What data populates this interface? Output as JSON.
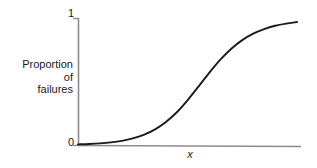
{
  "figure": {
    "background_color": "#ffffff",
    "axis_color": "#8c8c8c",
    "curve_color": "#1a1a1a",
    "y_axis_label_lines": [
      "Proportion",
      "of",
      "failures"
    ],
    "x_axis_label": "x",
    "y_tick_top": "1",
    "y_tick_bottom": "0"
  },
  "chart_data": {
    "type": "line",
    "title": "",
    "subtitle": "",
    "xlabel": "x",
    "ylabel": "Proportion of failures",
    "ylim": [
      0,
      1
    ],
    "xlim": [
      0,
      1
    ],
    "ytick_labels": [
      "0",
      "1"
    ],
    "ytick_values": [
      0,
      1
    ],
    "xtick_labels": [],
    "grid": false,
    "legend": null,
    "annotations": [],
    "series": [
      {
        "name": "Proportion of failures",
        "shape": "logistic sigmoid",
        "color": "#1a1a1a",
        "x": [
          0.0,
          0.05,
          0.1,
          0.15,
          0.2,
          0.25,
          0.3,
          0.35,
          0.4,
          0.45,
          0.5,
          0.55,
          0.6,
          0.65,
          0.7,
          0.75,
          0.8,
          0.85,
          0.9,
          0.95,
          1.0
        ],
        "values": [
          0.005,
          0.008,
          0.013,
          0.021,
          0.033,
          0.052,
          0.08,
          0.121,
          0.179,
          0.256,
          0.352,
          0.46,
          0.57,
          0.672,
          0.758,
          0.826,
          0.877,
          0.913,
          0.939,
          0.956,
          0.968
        ]
      }
    ]
  }
}
